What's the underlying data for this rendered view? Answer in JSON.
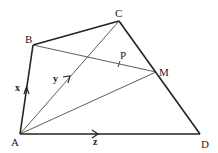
{
  "diagram": {
    "type": "geometry",
    "points": {
      "A": {
        "label": "A",
        "x": 20,
        "y": 134
      },
      "B": {
        "label": "B",
        "x": 33,
        "y": 45
      },
      "C": {
        "label": "C",
        "x": 119,
        "y": 21
      },
      "D": {
        "label": "D",
        "x": 200,
        "y": 134
      },
      "M": {
        "label": "M",
        "x": 156,
        "y": 72
      },
      "P": {
        "label": "P",
        "x": 119,
        "y": 64
      }
    },
    "vectors": {
      "x": {
        "label": "x",
        "from": "A",
        "to": "B"
      },
      "y": {
        "label": "y",
        "from": "A",
        "to": "C"
      },
      "z": {
        "label": "z",
        "from": "A",
        "to": "D"
      }
    },
    "edges_thick": [
      "AB",
      "BC",
      "CD",
      "AD"
    ],
    "edges_thin": [
      "AC",
      "AM",
      "BM"
    ]
  }
}
